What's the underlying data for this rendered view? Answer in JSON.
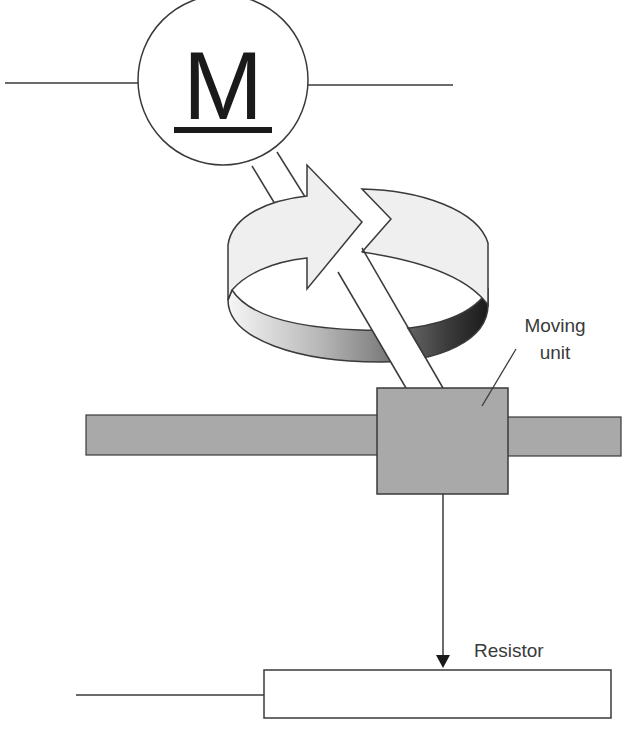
{
  "diagram": {
    "type": "potentiometer-motor-schematic",
    "motor": {
      "symbol": "M",
      "underlined": true,
      "icon": "motor-circle-icon"
    },
    "rotation": {
      "icon": "rotation-arrow-ring-icon",
      "direction": "clockwise"
    },
    "labels": {
      "moving_unit_line1": "Moving",
      "moving_unit_line2": "unit",
      "resistor": "Resistor"
    },
    "colors": {
      "stroke": "#3a3a3a",
      "slider_fill": "#a9a9a9",
      "ribbon_light": "#efefef",
      "ribbon_dark": "#1e1e1e",
      "background": "#ffffff"
    }
  }
}
